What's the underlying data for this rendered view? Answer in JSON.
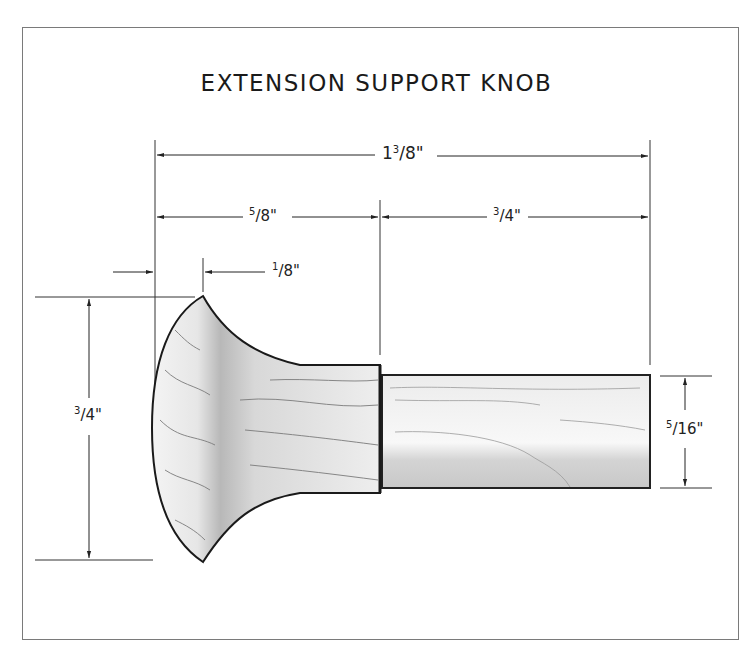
{
  "title": "EXTENSION SUPPORT KNOB",
  "dimensions": {
    "overall_length": {
      "whole": "1",
      "num": "3",
      "den": "8",
      "unit": "\""
    },
    "head_length": {
      "whole": "",
      "num": "5",
      "den": "8",
      "unit": "\""
    },
    "tenon_length": {
      "whole": "",
      "num": "3",
      "den": "4",
      "unit": "\""
    },
    "rim_offset": {
      "whole": "",
      "num": "1",
      "den": "8",
      "unit": "\""
    },
    "head_diameter": {
      "whole": "",
      "num": "3",
      "den": "4",
      "unit": "\""
    },
    "tenon_diameter": {
      "whole": "",
      "num": "5",
      "den": "16",
      "unit": "\""
    }
  },
  "colors": {
    "line": "#222222",
    "frame": "#7a7a7a",
    "wood_light": "#e8e8e8",
    "wood_dark": "#8a8a8a"
  }
}
